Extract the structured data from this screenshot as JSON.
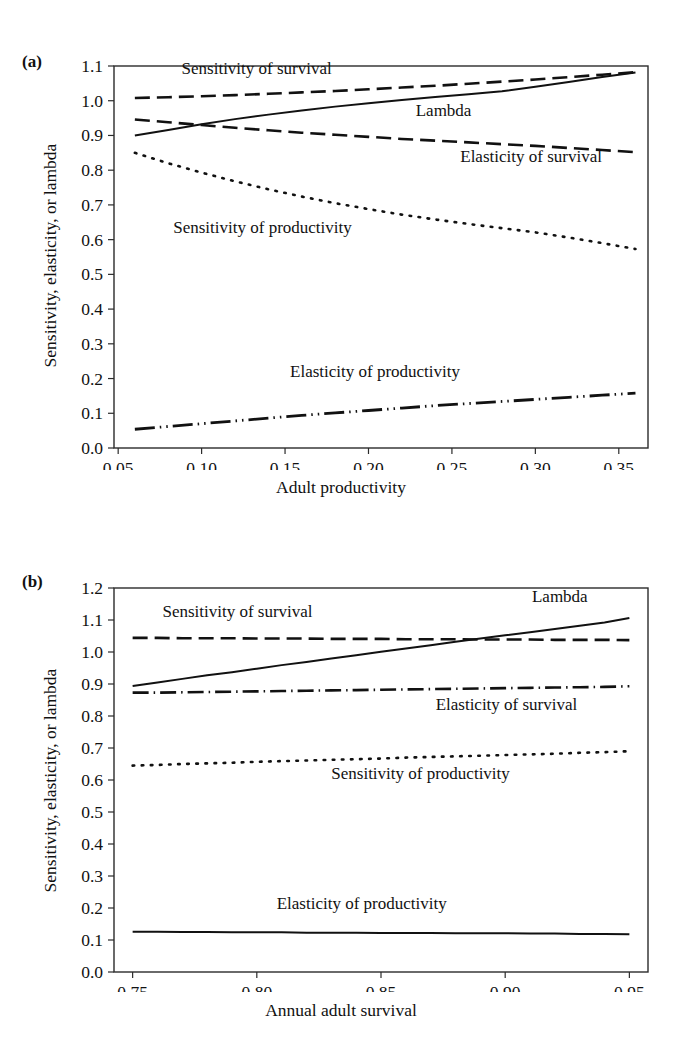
{
  "figure": {
    "ylabel": "Sensitivity, elasticity, or lambda"
  },
  "panels": [
    {
      "letter": "(a)",
      "xlabel": "Adult productivity",
      "labels": {
        "sensitivity_survival": "Sensitivity of survival",
        "lambda": "Lambda",
        "elasticity_survival": "Elasticity of survival",
        "sensitivity_productivity": "Sensitivity of productivity",
        "elasticity_productivity": "Elasticity of productivity"
      }
    },
    {
      "letter": "(b)",
      "xlabel": "Annual adult survival",
      "labels": {
        "sensitivity_survival": "Sensitivity of survival",
        "lambda": "Lambda",
        "elasticity_survival": "Elasticity of survival",
        "sensitivity_productivity": "Sensitivity of productivity",
        "elasticity_productivity": "Elasticity of productivity"
      }
    }
  ],
  "chart_data": [
    {
      "type": "line",
      "panel": "(a)",
      "title": "",
      "xlabel": "Adult productivity",
      "ylabel": "Sensitivity, elasticity, or lambda",
      "xlim": [
        0.0475,
        0.3675
      ],
      "ylim": [
        0.0,
        1.1
      ],
      "xticks": [
        0.05,
        0.1,
        0.15,
        0.2,
        0.25,
        0.3,
        0.35
      ],
      "xticklabels": [
        "0.05",
        "0.10",
        "0.15",
        "0.20",
        "0.25",
        "0.30",
        "0.35"
      ],
      "yticks": [
        0.0,
        0.1,
        0.2,
        0.3,
        0.4,
        0.5,
        0.6,
        0.7,
        0.8,
        0.9,
        1.0,
        1.1
      ],
      "yticklabels": [
        "0.0",
        "0.1",
        "0.2",
        "0.3",
        "0.4",
        "0.5",
        "0.6",
        "0.7",
        "0.8",
        "0.9",
        "1.0",
        "1.1"
      ],
      "grid": false,
      "legend": "inline-annotations",
      "x": [
        0.06,
        0.08,
        0.1,
        0.12,
        0.14,
        0.16,
        0.18,
        0.2,
        0.22,
        0.24,
        0.26,
        0.28,
        0.3,
        0.32,
        0.34,
        0.36
      ],
      "series": [
        {
          "name": "Sensitivity of survival",
          "style": "dashed",
          "values": [
            1.008,
            1.01,
            1.013,
            1.016,
            1.02,
            1.024,
            1.028,
            1.033,
            1.038,
            1.043,
            1.049,
            1.055,
            1.061,
            1.068,
            1.075,
            1.082
          ]
        },
        {
          "name": "Lambda",
          "style": "solid",
          "values": [
            0.9,
            0.916,
            0.932,
            0.947,
            0.96,
            0.972,
            0.983,
            0.993,
            1.002,
            1.011,
            1.019,
            1.027,
            1.04,
            1.054,
            1.068,
            1.081
          ]
        },
        {
          "name": "Elasticity of survival",
          "style": "dashed",
          "values": [
            0.946,
            0.938,
            0.93,
            0.922,
            0.915,
            0.908,
            0.902,
            0.896,
            0.89,
            0.885,
            0.88,
            0.875,
            0.87,
            0.864,
            0.858,
            0.852
          ]
        },
        {
          "name": "Sensitivity of productivity",
          "style": "dotted",
          "values": [
            0.85,
            0.82,
            0.793,
            0.768,
            0.745,
            0.724,
            0.705,
            0.688,
            0.672,
            0.658,
            0.645,
            0.633,
            0.621,
            0.606,
            0.59,
            0.573
          ]
        },
        {
          "name": "Elasticity of productivity",
          "style": "dashdotdot",
          "values": [
            0.054,
            0.062,
            0.07,
            0.078,
            0.086,
            0.094,
            0.101,
            0.108,
            0.115,
            0.122,
            0.128,
            0.134,
            0.14,
            0.146,
            0.152,
            0.158
          ]
        }
      ],
      "annotations": [
        {
          "text": "Sensitivity of survival",
          "x": 0.088,
          "y": 1.078,
          "anchor": "start"
        },
        {
          "text": "Lambda",
          "x": 0.245,
          "y": 0.955,
          "anchor": "middle"
        },
        {
          "text": "Elasticity of survival",
          "x": 0.255,
          "y": 0.825,
          "anchor": "start"
        },
        {
          "text": "Sensitivity of productivity",
          "x": 0.083,
          "y": 0.618,
          "anchor": "start"
        },
        {
          "text": "Elasticity of productivity",
          "x": 0.153,
          "y": 0.205,
          "anchor": "start"
        }
      ]
    },
    {
      "type": "line",
      "panel": "(b)",
      "title": "",
      "xlabel": "Annual adult survival",
      "ylabel": "Sensitivity, elasticity, or lambda",
      "xlim": [
        0.7425,
        0.9575
      ],
      "ylim": [
        0.0,
        1.2
      ],
      "xticks": [
        0.75,
        0.8,
        0.85,
        0.9,
        0.95
      ],
      "xticklabels": [
        "0.75",
        "0.80",
        "0.85",
        "0.90",
        "0.95"
      ],
      "yticks": [
        0.0,
        0.1,
        0.2,
        0.3,
        0.4,
        0.5,
        0.6,
        0.7,
        0.8,
        0.9,
        1.0,
        1.1,
        1.2
      ],
      "yticklabels": [
        "0.0",
        "0.1",
        "0.2",
        "0.3",
        "0.4",
        "0.5",
        "0.6",
        "0.7",
        "0.8",
        "0.9",
        "1.0",
        "1.1",
        "1.2"
      ],
      "grid": false,
      "legend": "inline-annotations",
      "x": [
        0.75,
        0.76,
        0.77,
        0.78,
        0.79,
        0.8,
        0.81,
        0.82,
        0.83,
        0.84,
        0.85,
        0.86,
        0.87,
        0.88,
        0.89,
        0.9,
        0.91,
        0.92,
        0.93,
        0.94,
        0.95
      ],
      "series": [
        {
          "name": "Sensitivity of survival",
          "style": "dashed",
          "values": [
            1.044,
            1.044,
            1.043,
            1.043,
            1.043,
            1.042,
            1.042,
            1.042,
            1.041,
            1.041,
            1.041,
            1.04,
            1.04,
            1.04,
            1.039,
            1.039,
            1.039,
            1.038,
            1.038,
            1.038,
            1.037
          ]
        },
        {
          "name": "Lambda",
          "style": "solid",
          "values": [
            0.894,
            0.905,
            0.916,
            0.927,
            0.937,
            0.948,
            0.959,
            0.969,
            0.98,
            0.99,
            1.001,
            1.011,
            1.021,
            1.032,
            1.042,
            1.052,
            1.062,
            1.072,
            1.082,
            1.092,
            1.106
          ]
        },
        {
          "name": "Elasticity of survival",
          "style": "dashdot",
          "values": [
            0.873,
            0.873,
            0.874,
            0.875,
            0.876,
            0.877,
            0.878,
            0.879,
            0.88,
            0.881,
            0.882,
            0.883,
            0.884,
            0.885,
            0.886,
            0.887,
            0.888,
            0.889,
            0.89,
            0.891,
            0.893
          ]
        },
        {
          "name": "Sensitivity of productivity",
          "style": "dotted",
          "values": [
            0.645,
            0.647,
            0.65,
            0.652,
            0.654,
            0.657,
            0.659,
            0.661,
            0.663,
            0.665,
            0.667,
            0.67,
            0.672,
            0.674,
            0.676,
            0.678,
            0.68,
            0.682,
            0.685,
            0.687,
            0.69
          ]
        },
        {
          "name": "Elasticity of productivity",
          "style": "solid",
          "values": [
            0.126,
            0.126,
            0.125,
            0.125,
            0.124,
            0.124,
            0.124,
            0.123,
            0.123,
            0.123,
            0.122,
            0.122,
            0.122,
            0.121,
            0.121,
            0.121,
            0.12,
            0.12,
            0.119,
            0.119,
            0.118
          ]
        }
      ],
      "annotations": [
        {
          "text": "Lambda",
          "x": 0.922,
          "y": 1.155,
          "anchor": "middle"
        },
        {
          "text": "Sensitivity of survival",
          "x": 0.762,
          "y": 1.108,
          "anchor": "start"
        },
        {
          "text": "Elasticity of survival",
          "x": 0.872,
          "y": 0.818,
          "anchor": "start"
        },
        {
          "text": "Sensitivity of productivity",
          "x": 0.83,
          "y": 0.603,
          "anchor": "start"
        },
        {
          "text": "Elasticity of productivity",
          "x": 0.808,
          "y": 0.197,
          "anchor": "start"
        }
      ]
    }
  ]
}
